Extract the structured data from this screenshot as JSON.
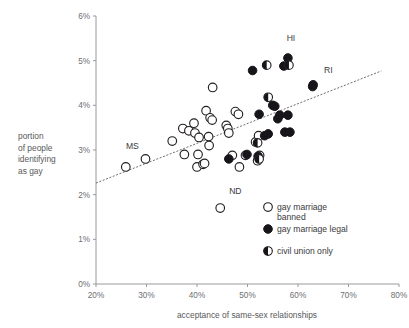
{
  "chart_data": {
    "type": "scatter",
    "title": "",
    "xlabel": "acceptance of same-sex relationships",
    "ylabel_lines": [
      "portion",
      "of people",
      "identifying",
      "as gay"
    ],
    "xlim": [
      20,
      80
    ],
    "ylim": [
      0,
      6
    ],
    "xticks": [
      "20%",
      "30%",
      "40%",
      "50%",
      "60%",
      "70%",
      "80%"
    ],
    "xtick_values": [
      20,
      30,
      40,
      50,
      60,
      70,
      80
    ],
    "yticks": [
      "0%",
      "1%",
      "2%",
      "3%",
      "4%",
      "5%",
      "6%"
    ],
    "ytick_values": [
      0,
      1,
      2,
      3,
      4,
      5,
      6
    ],
    "grid": false,
    "legend_position": "bottom-right",
    "legend": [
      {
        "label": "gay marriage banned",
        "marker": "open-circle",
        "series": "banned"
      },
      {
        "label": "gay marriage legal",
        "marker": "filled-circle",
        "series": "legal"
      },
      {
        "label": "civil union only",
        "marker": "half-filled-circle",
        "series": "civil_union"
      }
    ],
    "annotations": [
      {
        "text": "HI",
        "x": 58.6,
        "y": 5.45
      },
      {
        "text": "RI",
        "x": 66.0,
        "y": 4.72
      },
      {
        "text": "MS",
        "x": 27.2,
        "y": 3.02
      },
      {
        "text": "ND",
        "x": 47.6,
        "y": 2.02
      }
    ],
    "trendline": {
      "x0": 20.0,
      "y0": 2.26,
      "x1": 76.5,
      "y1": 4.77,
      "style": "dashed"
    },
    "series": [
      {
        "name": "gay marriage banned",
        "marker": "open-circle",
        "points": [
          [
            25.9,
            2.62
          ],
          [
            29.8,
            2.8
          ],
          [
            35.1,
            3.2
          ],
          [
            37.2,
            3.48
          ],
          [
            37.5,
            2.9
          ],
          [
            38.4,
            3.43
          ],
          [
            39.4,
            3.6
          ],
          [
            39.6,
            3.38
          ],
          [
            40.4,
            3.28
          ],
          [
            40.2,
            2.9
          ],
          [
            40.0,
            2.62
          ],
          [
            41.2,
            2.68
          ],
          [
            41.5,
            2.7
          ],
          [
            41.8,
            3.88
          ],
          [
            42.3,
            3.3
          ],
          [
            42.4,
            3.1
          ],
          [
            42.6,
            3.72
          ],
          [
            43.0,
            3.67
          ],
          [
            43.1,
            4.4
          ],
          [
            44.6,
            1.7
          ],
          [
            45.8,
            3.55
          ],
          [
            46.1,
            3.48
          ],
          [
            46.3,
            3.38
          ],
          [
            47.0,
            2.88
          ],
          [
            47.6,
            3.86
          ],
          [
            48.2,
            3.8
          ],
          [
            48.4,
            2.62
          ],
          [
            49.6,
            2.88
          ],
          [
            51.6,
            3.18
          ],
          [
            52.0,
            2.76
          ],
          [
            52.4,
            2.88
          ],
          [
            52.2,
            3.32
          ]
        ]
      },
      {
        "name": "gay marriage legal",
        "marker": "filled-circle",
        "points": [
          [
            46.3,
            2.8
          ],
          [
            49.9,
            2.9
          ],
          [
            51.0,
            4.78
          ],
          [
            52.3,
            3.8
          ],
          [
            53.4,
            3.32
          ],
          [
            54.1,
            3.36
          ],
          [
            55.0,
            4.0
          ],
          [
            55.4,
            3.98
          ],
          [
            56.0,
            3.7
          ],
          [
            56.4,
            3.78
          ],
          [
            57.4,
            3.4
          ],
          [
            58.0,
            3.78
          ],
          [
            57.2,
            4.88
          ],
          [
            58.0,
            5.06
          ],
          [
            58.4,
            3.4
          ],
          [
            62.9,
            4.42
          ],
          [
            63.0,
            4.46
          ],
          [
            52.1,
            2.86
          ]
        ]
      },
      {
        "name": "civil union only",
        "marker": "half-filled-circle",
        "points": [
          [
            53.8,
            4.9
          ],
          [
            54.1,
            4.18
          ],
          [
            52.0,
            3.16
          ],
          [
            52.3,
            2.8
          ],
          [
            58.2,
            4.9
          ]
        ]
      }
    ]
  }
}
